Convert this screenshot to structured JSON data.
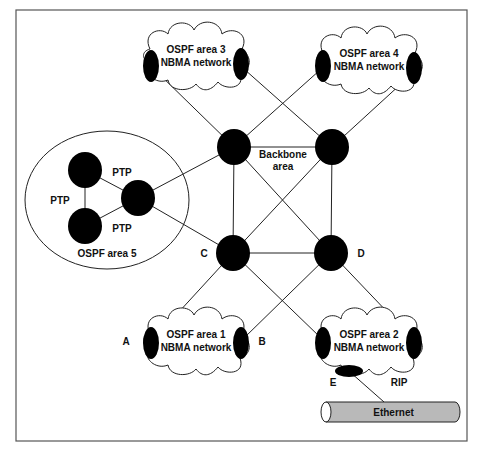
{
  "diagram": {
    "frame": {
      "x": 16,
      "y": 10,
      "w": 451,
      "h": 431
    },
    "colors": {
      "node": "#000000",
      "line": "#222222",
      "ethernet_fill": "#b9b9b9",
      "frame": "#555555"
    },
    "backbone": {
      "label_line1": "Backbone",
      "label_line2": "area",
      "label_pos": [
        283,
        158
      ],
      "nodes": [
        {
          "id": "bb-tl",
          "x": 234,
          "y": 147
        },
        {
          "id": "bb-tr",
          "x": 332,
          "y": 147
        },
        {
          "id": "C",
          "x": 233,
          "y": 253,
          "label": "C",
          "label_pos": [
            204,
            257
          ]
        },
        {
          "id": "D",
          "x": 331,
          "y": 253,
          "label": "D",
          "label_pos": [
            361,
            257
          ]
        }
      ]
    },
    "clouds": [
      {
        "id": "area3",
        "line1": "OSPF area 3",
        "line2": "NBMA network",
        "cx": 196,
        "cy": 55,
        "left_router": [
          151,
          66
        ],
        "right_router": [
          241,
          64
        ]
      },
      {
        "id": "area4",
        "line1": "OSPF area 4",
        "line2": "NBMA network",
        "cx": 369,
        "cy": 59,
        "left_router": [
          323,
          66
        ],
        "right_router": [
          414,
          68
        ]
      },
      {
        "id": "area1",
        "line1": "OSPF area 1",
        "line2": "NBMA network",
        "cx": 196,
        "cy": 340,
        "left_router": [
          151,
          343
        ],
        "right_router": [
          241,
          343
        ],
        "left_label": "A",
        "left_label_pos": [
          126,
          345
        ],
        "right_label": "B",
        "right_label_pos": [
          262,
          345
        ]
      },
      {
        "id": "area2",
        "line1": "OSPF area 2",
        "line2": "NBMA network",
        "cx": 369,
        "cy": 340,
        "left_router": [
          323,
          343
        ],
        "right_router": [
          414,
          343
        ],
        "bottom_router": [
          349,
          371
        ],
        "bottom_label": "E",
        "bottom_label_pos": [
          333,
          386
        ],
        "extra_label": "RIP",
        "extra_label_pos": [
          399,
          386
        ]
      }
    ],
    "area5": {
      "label": "OSPF area 5",
      "ellipse": {
        "cx": 107,
        "cy": 200,
        "rx": 82,
        "ry": 69
      },
      "nodes": [
        {
          "id": "a5-top",
          "x": 85,
          "y": 170
        },
        {
          "id": "a5-bottom",
          "x": 85,
          "y": 226
        },
        {
          "id": "a5-right",
          "x": 138,
          "y": 198
        }
      ],
      "ptp_labels": [
        {
          "text": "PTP",
          "x": 122,
          "y": 176
        },
        {
          "text": "PTP",
          "x": 60,
          "y": 204
        },
        {
          "text": "PTP",
          "x": 122,
          "y": 232
        }
      ],
      "label_pos": [
        107,
        257
      ]
    },
    "ethernet": {
      "label": "Ethernet",
      "x": 326,
      "y": 402,
      "w": 129,
      "h": 20
    },
    "edges": [
      [
        [
          234,
          147
        ],
        [
          332,
          147
        ]
      ],
      [
        [
          234,
          147
        ],
        [
          233,
          253
        ]
      ],
      [
        [
          332,
          147
        ],
        [
          331,
          253
        ]
      ],
      [
        [
          233,
          253
        ],
        [
          331,
          253
        ]
      ],
      [
        [
          234,
          147
        ],
        [
          331,
          253
        ]
      ],
      [
        [
          332,
          147
        ],
        [
          233,
          253
        ]
      ],
      [
        [
          155,
          70
        ],
        [
          234,
          147
        ]
      ],
      [
        [
          244,
          69
        ],
        [
          332,
          147
        ]
      ],
      [
        [
          320,
          70
        ],
        [
          234,
          147
        ]
      ],
      [
        [
          414,
          72
        ],
        [
          332,
          147
        ]
      ],
      [
        [
          155,
          338
        ],
        [
          233,
          253
        ]
      ],
      [
        [
          233,
          253
        ],
        [
          321,
          338
        ]
      ],
      [
        [
          244,
          338
        ],
        [
          331,
          253
        ]
      ],
      [
        [
          331,
          253
        ],
        [
          412,
          338
        ]
      ],
      [
        [
          138,
          198
        ],
        [
          234,
          147
        ]
      ],
      [
        [
          138,
          198
        ],
        [
          233,
          253
        ]
      ],
      [
        [
          85,
          170
        ],
        [
          85,
          226
        ]
      ],
      [
        [
          85,
          170
        ],
        [
          138,
          198
        ]
      ],
      [
        [
          85,
          226
        ],
        [
          138,
          198
        ]
      ],
      [
        [
          350,
          372
        ],
        [
          384,
          402
        ]
      ]
    ]
  }
}
